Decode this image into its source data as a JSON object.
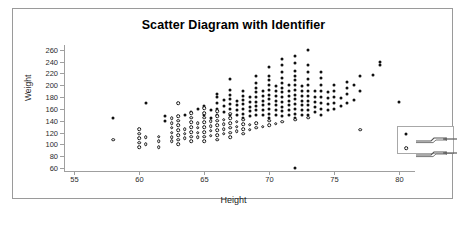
{
  "clipped_header": [
    "",
    "",
    ""
  ],
  "chart_data": {
    "type": "scatter",
    "title": "Scatter Diagram with Identifier",
    "xlabel": "Height",
    "ylabel": "Weight",
    "xlim": [
      54.2,
      81.2
    ],
    "ylim": [
      55,
      268
    ],
    "xticks": [
      55,
      60,
      65,
      70,
      75,
      80
    ],
    "yticks": [
      60,
      80,
      100,
      120,
      140,
      160,
      180,
      200,
      220,
      240,
      260
    ],
    "grid": false,
    "legend_position": "bottom-right",
    "marker_colors": {
      "filled": "#101010",
      "open": "#171717"
    },
    "series": [
      {
        "name": "group-filled",
        "marker": "filled-circle",
        "label": "",
        "points": [
          [
            58.0,
            145
          ],
          [
            60.5,
            170
          ],
          [
            62.0,
            148
          ],
          [
            62.0,
            140
          ],
          [
            63.5,
            150
          ],
          [
            64.0,
            155
          ],
          [
            64.5,
            160
          ],
          [
            65.0,
            150
          ],
          [
            65.0,
            165
          ],
          [
            65.5,
            145
          ],
          [
            65.5,
            158
          ],
          [
            66.0,
            150
          ],
          [
            66.0,
            160
          ],
          [
            66.0,
            170
          ],
          [
            66.0,
            180
          ],
          [
            66.0,
            185
          ],
          [
            66.5,
            155
          ],
          [
            66.5,
            165
          ],
          [
            66.5,
            175
          ],
          [
            67.0,
            150
          ],
          [
            67.0,
            160
          ],
          [
            67.0,
            168
          ],
          [
            67.0,
            176
          ],
          [
            67.0,
            184
          ],
          [
            67.0,
            192
          ],
          [
            67.0,
            210
          ],
          [
            67.5,
            150
          ],
          [
            67.5,
            158
          ],
          [
            67.5,
            166
          ],
          [
            67.5,
            174
          ],
          [
            68.0,
            145
          ],
          [
            68.0,
            152
          ],
          [
            68.0,
            160
          ],
          [
            68.0,
            168
          ],
          [
            68.0,
            175
          ],
          [
            68.0,
            182
          ],
          [
            68.0,
            190
          ],
          [
            68.5,
            148
          ],
          [
            68.5,
            156
          ],
          [
            68.5,
            164
          ],
          [
            68.5,
            172
          ],
          [
            68.5,
            180
          ],
          [
            69.0,
            150
          ],
          [
            69.0,
            158
          ],
          [
            69.0,
            165
          ],
          [
            69.0,
            172
          ],
          [
            69.0,
            180
          ],
          [
            69.0,
            188
          ],
          [
            69.0,
            196
          ],
          [
            69.0,
            204
          ],
          [
            69.0,
            215
          ],
          [
            69.5,
            150
          ],
          [
            69.5,
            158
          ],
          [
            69.5,
            166
          ],
          [
            69.5,
            174
          ],
          [
            69.5,
            182
          ],
          [
            69.5,
            190
          ],
          [
            70.0,
            145
          ],
          [
            70.0,
            152
          ],
          [
            70.0,
            160
          ],
          [
            70.0,
            168
          ],
          [
            70.0,
            176
          ],
          [
            70.0,
            184
          ],
          [
            70.0,
            192
          ],
          [
            70.0,
            200
          ],
          [
            70.0,
            208
          ],
          [
            70.0,
            216
          ],
          [
            70.0,
            230
          ],
          [
            70.5,
            150
          ],
          [
            70.5,
            158
          ],
          [
            70.5,
            166
          ],
          [
            70.5,
            174
          ],
          [
            70.5,
            182
          ],
          [
            70.5,
            190
          ],
          [
            70.5,
            198
          ],
          [
            71.0,
            148
          ],
          [
            71.0,
            156
          ],
          [
            71.0,
            164
          ],
          [
            71.0,
            172
          ],
          [
            71.0,
            180
          ],
          [
            71.0,
            188
          ],
          [
            71.0,
            196
          ],
          [
            71.0,
            204
          ],
          [
            71.0,
            212
          ],
          [
            71.0,
            222
          ],
          [
            71.0,
            235
          ],
          [
            71.0,
            245
          ],
          [
            71.5,
            150
          ],
          [
            71.5,
            158
          ],
          [
            71.5,
            166
          ],
          [
            71.5,
            174
          ],
          [
            71.5,
            182
          ],
          [
            71.5,
            190
          ],
          [
            71.5,
            200
          ],
          [
            72.0,
            60
          ],
          [
            72.0,
            145
          ],
          [
            72.0,
            152
          ],
          [
            72.0,
            160
          ],
          [
            72.0,
            168
          ],
          [
            72.0,
            176
          ],
          [
            72.0,
            184
          ],
          [
            72.0,
            192
          ],
          [
            72.0,
            200
          ],
          [
            72.0,
            208
          ],
          [
            72.0,
            216
          ],
          [
            72.0,
            224
          ],
          [
            72.0,
            238
          ],
          [
            72.0,
            250
          ],
          [
            72.5,
            150
          ],
          [
            72.5,
            158
          ],
          [
            72.5,
            166
          ],
          [
            72.5,
            174
          ],
          [
            72.5,
            182
          ],
          [
            72.5,
            190
          ],
          [
            72.5,
            198
          ],
          [
            73.0,
            150
          ],
          [
            73.0,
            158
          ],
          [
            73.0,
            166
          ],
          [
            73.0,
            174
          ],
          [
            73.0,
            182
          ],
          [
            73.0,
            190
          ],
          [
            73.0,
            200
          ],
          [
            73.0,
            210
          ],
          [
            73.0,
            222
          ],
          [
            73.0,
            235
          ],
          [
            73.0,
            260
          ],
          [
            73.5,
            155
          ],
          [
            73.5,
            163
          ],
          [
            73.5,
            171
          ],
          [
            73.5,
            180
          ],
          [
            73.5,
            190
          ],
          [
            74.0,
            150
          ],
          [
            74.0,
            160
          ],
          [
            74.0,
            170
          ],
          [
            74.0,
            180
          ],
          [
            74.0,
            190
          ],
          [
            74.0,
            200
          ],
          [
            74.0,
            212
          ],
          [
            74.0,
            222
          ],
          [
            74.5,
            158
          ],
          [
            74.5,
            168
          ],
          [
            74.5,
            178
          ],
          [
            74.5,
            188
          ],
          [
            75.0,
            160
          ],
          [
            75.0,
            170
          ],
          [
            75.0,
            180
          ],
          [
            75.0,
            190
          ],
          [
            75.0,
            200
          ],
          [
            75.5,
            165
          ],
          [
            75.5,
            178
          ],
          [
            76.0,
            170
          ],
          [
            76.0,
            185
          ],
          [
            76.0,
            195
          ],
          [
            76.0,
            205
          ],
          [
            76.5,
            175
          ],
          [
            76.5,
            200
          ],
          [
            77.0,
            190
          ],
          [
            77.0,
            215
          ],
          [
            78.0,
            218
          ],
          [
            78.5,
            235
          ],
          [
            78.5,
            240
          ],
          [
            80.0,
            172
          ]
        ]
      },
      {
        "name": "group-open",
        "marker": "open-circle",
        "label": "",
        "points": [
          [
            58.0,
            108
          ],
          [
            60.0,
            95
          ],
          [
            60.0,
            103
          ],
          [
            60.0,
            110
          ],
          [
            60.0,
            118
          ],
          [
            60.0,
            126
          ],
          [
            60.5,
            100
          ],
          [
            60.5,
            112
          ],
          [
            61.5,
            105
          ],
          [
            61.5,
            113
          ],
          [
            61.5,
            95
          ],
          [
            62.5,
            105
          ],
          [
            62.5,
            112
          ],
          [
            62.5,
            120
          ],
          [
            62.5,
            128
          ],
          [
            62.5,
            136
          ],
          [
            62.5,
            144
          ],
          [
            63.0,
            100
          ],
          [
            63.0,
            108
          ],
          [
            63.0,
            116
          ],
          [
            63.0,
            124
          ],
          [
            63.0,
            132
          ],
          [
            63.0,
            140
          ],
          [
            63.0,
            148
          ],
          [
            63.0,
            170
          ],
          [
            63.5,
            110
          ],
          [
            63.5,
            118
          ],
          [
            63.5,
            126
          ],
          [
            64.0,
            105
          ],
          [
            64.0,
            113
          ],
          [
            64.0,
            121
          ],
          [
            64.0,
            129
          ],
          [
            64.0,
            137
          ],
          [
            64.0,
            145
          ],
          [
            64.0,
            153
          ],
          [
            64.5,
            112
          ],
          [
            64.5,
            120
          ],
          [
            64.5,
            128
          ],
          [
            64.5,
            136
          ],
          [
            65.0,
            105
          ],
          [
            65.0,
            113
          ],
          [
            65.0,
            121
          ],
          [
            65.0,
            129
          ],
          [
            65.0,
            137
          ],
          [
            65.0,
            145
          ],
          [
            65.0,
            153
          ],
          [
            65.0,
            161
          ],
          [
            65.5,
            115
          ],
          [
            65.5,
            123
          ],
          [
            65.5,
            131
          ],
          [
            65.5,
            139
          ],
          [
            66.0,
            108
          ],
          [
            66.0,
            116
          ],
          [
            66.0,
            124
          ],
          [
            66.0,
            132
          ],
          [
            66.0,
            140
          ],
          [
            66.0,
            148
          ],
          [
            66.0,
            156
          ],
          [
            66.5,
            118
          ],
          [
            66.5,
            126
          ],
          [
            66.5,
            134
          ],
          [
            66.5,
            142
          ],
          [
            67.0,
            112
          ],
          [
            67.0,
            120
          ],
          [
            67.0,
            128
          ],
          [
            67.0,
            136
          ],
          [
            67.0,
            144
          ],
          [
            67.0,
            152
          ],
          [
            67.5,
            122
          ],
          [
            67.5,
            130
          ],
          [
            67.5,
            138
          ],
          [
            68.0,
            118
          ],
          [
            68.0,
            126
          ],
          [
            68.0,
            134
          ],
          [
            68.0,
            142
          ],
          [
            68.5,
            125
          ],
          [
            68.5,
            133
          ],
          [
            69.0,
            128
          ],
          [
            69.0,
            136
          ],
          [
            69.5,
            130
          ],
          [
            70.0,
            132
          ],
          [
            70.0,
            140
          ],
          [
            70.5,
            135
          ],
          [
            71.0,
            138
          ],
          [
            72.0,
            142
          ],
          [
            73.0,
            145
          ],
          [
            77.0,
            125
          ]
        ]
      }
    ]
  },
  "legend": {
    "entries": [
      {
        "marker": "filled-circle",
        "label": ""
      },
      {
        "marker": "open-circle",
        "label": ""
      }
    ]
  }
}
